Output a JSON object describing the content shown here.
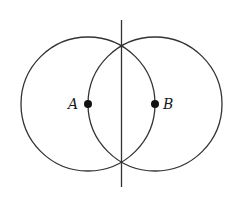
{
  "diagram": {
    "colors": {
      "stroke": "#333333",
      "point": "#111111",
      "background": "#ffffff"
    },
    "points": [
      {
        "label": "A",
        "x": 88,
        "y": 104
      },
      {
        "label": "B",
        "x": 155,
        "y": 104
      }
    ],
    "circles": [
      {
        "center": "A",
        "cx": 88,
        "cy": 104,
        "r": 67
      },
      {
        "center": "B",
        "cx": 155,
        "cy": 104,
        "r": 67
      }
    ],
    "line": {
      "x": 121.5,
      "y1": 20,
      "y2": 187,
      "description": "perpendicular bisector through circle intersections"
    }
  }
}
